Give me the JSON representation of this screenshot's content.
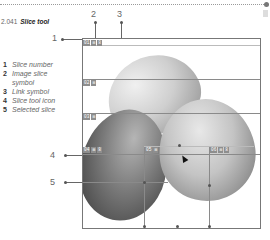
{
  "figure": {
    "number": "2.041",
    "title": "Slice tool"
  },
  "callouts": [
    "1",
    "2",
    "3",
    "4",
    "5"
  ],
  "legend": [
    {
      "num": "1",
      "text": "Slice number"
    },
    {
      "num": "2",
      "text": "Image slice symbol"
    },
    {
      "num": "3",
      "text": "Link symbol"
    },
    {
      "num": "4",
      "text": "Slice tool icon"
    },
    {
      "num": "5",
      "text": "Selected slice"
    }
  ],
  "slices": [
    {
      "number": "01",
      "symbols": [
        "⊠",
        "8"
      ]
    },
    {
      "number": "02",
      "symbols": [
        "⊠"
      ]
    },
    {
      "number": "03",
      "symbols": [
        "⊠"
      ]
    },
    {
      "number": "04",
      "symbols": [
        "⊠",
        "8"
      ]
    },
    {
      "number": "05",
      "symbols": [
        "⊠"
      ]
    },
    {
      "number": "06",
      "symbols": [
        "⊠",
        "8"
      ]
    }
  ],
  "colors": {
    "badge": "#8e8e8e",
    "guide": "#8a8a8a",
    "border": "#777777"
  }
}
